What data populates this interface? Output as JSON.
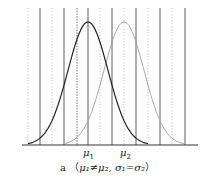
{
  "figure": {
    "caption_prefix": "a",
    "caption_open": "（",
    "caption_close": "）",
    "caption_cond1": "μ₁≠μ₂,",
    "caption_cond2": "σ₁=σ₂",
    "labels": {
      "mu1": "μ",
      "mu1_sub": "1",
      "mu2": "μ",
      "mu2_sub": "2"
    }
  },
  "chart_data": {
    "type": "line",
    "xlabel": "",
    "ylabel": "",
    "grid": "vertical lines (alternating solid and dotted)",
    "series": [
      {
        "name": "distribution 1",
        "mean_label": "μ1",
        "color": "#222222",
        "peak_x": 88,
        "sigma": 20
      },
      {
        "name": "distribution 2",
        "mean_label": "μ2",
        "color": "#aaaaaa",
        "peak_x": 124,
        "sigma": 20
      }
    ],
    "annotations": [
      "μ1",
      "μ2"
    ],
    "colors": {
      "curve1": "#222222",
      "curve2": "#aaaaaa",
      "solid_grid": "#444444",
      "dotted_grid": "#bbbbbb",
      "axis": "#333333"
    }
  }
}
